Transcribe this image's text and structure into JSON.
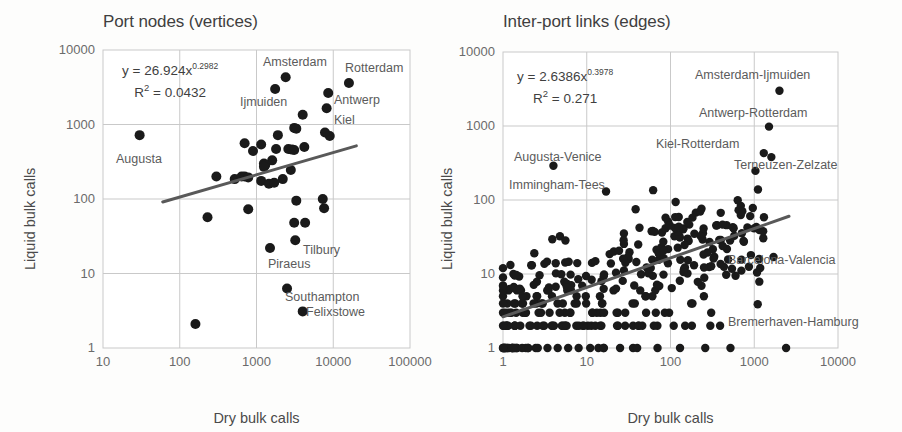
{
  "figure": {
    "background_color": "#fdfdfc",
    "text_color": "#4a4a4a",
    "point_color": "#1a1a1a",
    "grid_color": "#c9c9c9",
    "trend_color": "#595959"
  },
  "panels": [
    {
      "id": "port-nodes",
      "title": "Port nodes (vertices)",
      "equation_main": "y = 26.924x",
      "equation_exponent": "0.2982",
      "equation_r2_prefix": "R",
      "equation_r2_sup": "2",
      "equation_r2_value": " = 0.0432",
      "xlabel": "Dry bulk calls",
      "ylabel": "Liquid bulk calls",
      "xticks": [
        "10",
        "100",
        "1000",
        "10000",
        "100000"
      ],
      "yticks": [
        "10000",
        "1000",
        "100",
        "10",
        "1"
      ],
      "annotations": [
        {
          "text": "Augusta",
          "x": 116,
          "y": 152
        },
        {
          "text": "Amsterdam",
          "x": 263,
          "y": 55
        },
        {
          "text": "Rotterdam",
          "x": 345,
          "y": 61
        },
        {
          "text": "Ijmuiden",
          "x": 240,
          "y": 95
        },
        {
          "text": "Antwerp",
          "x": 334,
          "y": 93
        },
        {
          "text": "Kiel",
          "x": 334,
          "y": 113
        },
        {
          "text": "Tilbury",
          "x": 303,
          "y": 243
        },
        {
          "text": "Piraeus",
          "x": 268,
          "y": 257
        },
        {
          "text": "Southampton",
          "x": 285,
          "y": 290
        },
        {
          "text": "Felixstowe",
          "x": 306,
          "y": 305
        }
      ]
    },
    {
      "id": "inter-port-links",
      "title": "Inter-port links (edges)",
      "equation_main": "y = 2.6386x",
      "equation_exponent": "0.3978",
      "equation_r2_prefix": "R",
      "equation_r2_sup": "2",
      "equation_r2_value": " = 0.271",
      "xlabel": "Dry bulk calls",
      "ylabel": "Liquid bulk calls",
      "xticks": [
        "1",
        "10",
        "100",
        "1000",
        "10000"
      ],
      "yticks": [
        "10000",
        "1000",
        "100",
        "10",
        "1"
      ],
      "annotations": [
        {
          "text": "Augusta-Venice",
          "x": 63,
          "y": 150
        },
        {
          "text": "Immingham-Tees",
          "x": 58,
          "y": 178
        },
        {
          "text": "Amsterdam-Ijmuiden",
          "x": 244,
          "y": 68
        },
        {
          "text": "Antwerp-Rotterdam",
          "x": 248,
          "y": 106
        },
        {
          "text": "Kiel-Rotterdam",
          "x": 205,
          "y": 137
        },
        {
          "text": "Terneuzen-Zelzate",
          "x": 283,
          "y": 158
        },
        {
          "text": "Barcelona-Valencia",
          "x": 277,
          "y": 253
        },
        {
          "text": "Bremerhaven-Hamburg",
          "x": 277,
          "y": 315
        }
      ]
    }
  ],
  "chart_data": [
    {
      "type": "scatter",
      "title": "Port nodes (vertices)",
      "xlabel": "Dry bulk calls",
      "ylabel": "Liquid bulk calls",
      "xscale": "log",
      "yscale": "log",
      "xlim": [
        10,
        100000
      ],
      "ylim": [
        1,
        10000
      ],
      "grid": true,
      "legend": "none",
      "trendline": {
        "equation": "y = 26.924x^0.2982",
        "r2": 0.0432,
        "coefficient": 26.924,
        "exponent": 0.2982,
        "x_start": 60,
        "x_end": 20000
      },
      "points": [
        {
          "x": 30,
          "y": 720,
          "label": "Augusta"
        },
        {
          "x": 2400,
          "y": 4300,
          "label": "Amsterdam"
        },
        {
          "x": 1750,
          "y": 3000,
          "label": "Ijmuiden"
        },
        {
          "x": 16000,
          "y": 3600,
          "label": "Rotterdam"
        },
        {
          "x": 8600,
          "y": 2650,
          "label": "Antwerp"
        },
        {
          "x": 8200,
          "y": 1650,
          "label": "Kiel"
        },
        {
          "x": 4000,
          "y": 1350,
          "label": ""
        },
        {
          "x": 3100,
          "y": 900,
          "label": ""
        },
        {
          "x": 3300,
          "y": 880,
          "label": ""
        },
        {
          "x": 9000,
          "y": 700,
          "label": ""
        },
        {
          "x": 1900,
          "y": 720,
          "label": ""
        },
        {
          "x": 700,
          "y": 560,
          "label": ""
        },
        {
          "x": 1150,
          "y": 540,
          "label": ""
        },
        {
          "x": 900,
          "y": 440,
          "label": ""
        },
        {
          "x": 1800,
          "y": 470,
          "label": ""
        },
        {
          "x": 2600,
          "y": 470,
          "label": ""
        },
        {
          "x": 2900,
          "y": 460,
          "label": ""
        },
        {
          "x": 3100,
          "y": 455,
          "label": ""
        },
        {
          "x": 4200,
          "y": 500,
          "label": ""
        },
        {
          "x": 7800,
          "y": 780,
          "label": ""
        },
        {
          "x": 1600,
          "y": 330,
          "label": ""
        },
        {
          "x": 1250,
          "y": 300,
          "label": ""
        },
        {
          "x": 1300,
          "y": 285,
          "label": ""
        },
        {
          "x": 1250,
          "y": 270,
          "label": ""
        },
        {
          "x": 2800,
          "y": 245,
          "label": ""
        },
        {
          "x": 300,
          "y": 200,
          "label": ""
        },
        {
          "x": 520,
          "y": 185,
          "label": ""
        },
        {
          "x": 640,
          "y": 200,
          "label": ""
        },
        {
          "x": 700,
          "y": 200,
          "label": ""
        },
        {
          "x": 780,
          "y": 195,
          "label": ""
        },
        {
          "x": 2200,
          "y": 185,
          "label": ""
        },
        {
          "x": 1150,
          "y": 175,
          "label": ""
        },
        {
          "x": 1450,
          "y": 160,
          "label": ""
        },
        {
          "x": 1700,
          "y": 165,
          "label": ""
        },
        {
          "x": 3300,
          "y": 95,
          "label": ""
        },
        {
          "x": 7300,
          "y": 100,
          "label": ""
        },
        {
          "x": 7600,
          "y": 75,
          "label": ""
        },
        {
          "x": 780,
          "y": 73,
          "label": ""
        },
        {
          "x": 230,
          "y": 57,
          "label": ""
        },
        {
          "x": 3100,
          "y": 48,
          "label": ""
        },
        {
          "x": 4300,
          "y": 48,
          "label": ""
        },
        {
          "x": 3200,
          "y": 28,
          "label": "Tilbury"
        },
        {
          "x": 1500,
          "y": 22,
          "label": "Piraeus"
        },
        {
          "x": 2500,
          "y": 6.3,
          "label": "Southampton"
        },
        {
          "x": 4000,
          "y": 3.1,
          "label": "Felixstowe"
        },
        {
          "x": 160,
          "y": 2.1,
          "label": ""
        }
      ]
    },
    {
      "type": "scatter",
      "title": "Inter-port links (edges)",
      "xlabel": "Dry bulk calls",
      "ylabel": "Liquid bulk calls",
      "xscale": "log",
      "yscale": "log",
      "xlim": [
        1,
        10000
      ],
      "ylim": [
        1,
        10000
      ],
      "grid": true,
      "legend": "none",
      "trendline": {
        "equation": "y = 2.6386x^0.3978",
        "r2": 0.271,
        "coefficient": 2.6386,
        "exponent": 0.3978,
        "x_start": 1,
        "x_end": 2600
      },
      "notable_points": [
        {
          "x": 4.0,
          "y": 290,
          "label": "Augusta-Venice"
        },
        {
          "x": 17,
          "y": 130,
          "label": "Immingham-Tees"
        },
        {
          "x": 2000,
          "y": 3000,
          "label": "Amsterdam-Ijmuiden"
        },
        {
          "x": 1500,
          "y": 980,
          "label": "Antwerp-Rotterdam"
        },
        {
          "x": 1300,
          "y": 430,
          "label": "Kiel-Rotterdam"
        },
        {
          "x": 1600,
          "y": 380,
          "label": "Terneuzen-Zelzate"
        },
        {
          "x": 1700,
          "y": 17,
          "label": "Barcelona-Valencia"
        },
        {
          "x": 1100,
          "y": 3.9,
          "label": "Bremerhaven-Hamburg"
        }
      ],
      "point_count": 300,
      "description": "Dense log-log scatter of inter-port link call pairs; many points pinned at y=1 and y=2 along the lower axis."
    }
  ]
}
